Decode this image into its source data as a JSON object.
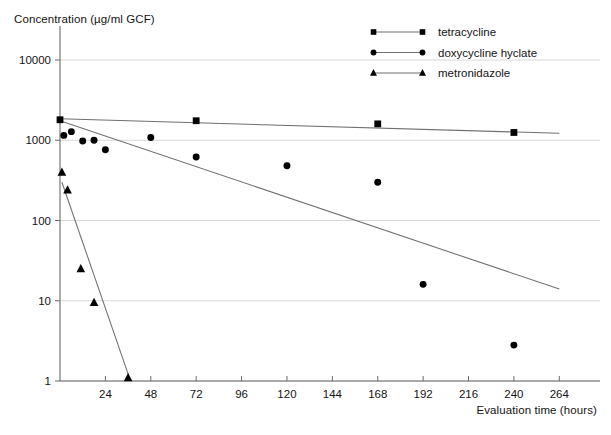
{
  "chart_data": {
    "type": "scatter",
    "title": "",
    "ylabel": "Concentration (µg/ml GCF)",
    "xlabel": "Evaluation time (hours)",
    "yscale": "log",
    "ylim": [
      1,
      10000
    ],
    "xlim": [
      0,
      276
    ],
    "grid": true,
    "legend_position": "top-right",
    "ytick_labels": [
      "1",
      "10",
      "100",
      "1000",
      "10000"
    ],
    "ytick_values": [
      1,
      10,
      100,
      1000,
      10000
    ],
    "xtick_labels": [
      "24",
      "48",
      "72",
      "96",
      "120",
      "144",
      "168",
      "192",
      "216",
      "240",
      "264"
    ],
    "xtick_values": [
      24,
      48,
      72,
      96,
      120,
      144,
      168,
      192,
      216,
      240,
      264
    ],
    "series": [
      {
        "name": "tetracycline",
        "marker": "square",
        "color": "#000000",
        "points": [
          {
            "x": 0,
            "y": 1800
          },
          {
            "x": 72,
            "y": 1750
          },
          {
            "x": 168,
            "y": 1600
          },
          {
            "x": 240,
            "y": 1250
          }
        ],
        "fit": [
          {
            "x": 0,
            "y": 1850
          },
          {
            "x": 264,
            "y": 1220
          }
        ]
      },
      {
        "name": "doxycycline hyclate",
        "marker": "circle",
        "color": "#000000",
        "points": [
          {
            "x": 2,
            "y": 1150
          },
          {
            "x": 6,
            "y": 1280
          },
          {
            "x": 12,
            "y": 980
          },
          {
            "x": 18,
            "y": 1000
          },
          {
            "x": 24,
            "y": 760
          },
          {
            "x": 48,
            "y": 1080
          },
          {
            "x": 72,
            "y": 620
          },
          {
            "x": 120,
            "y": 480
          },
          {
            "x": 168,
            "y": 300
          },
          {
            "x": 192,
            "y": 16
          },
          {
            "x": 240,
            "y": 2.8
          }
        ],
        "fit": [
          {
            "x": 0,
            "y": 1750
          },
          {
            "x": 264,
            "y": 14
          }
        ]
      },
      {
        "name": "metronidazole",
        "marker": "triangle",
        "color": "#000000",
        "points": [
          {
            "x": 1,
            "y": 400
          },
          {
            "x": 4,
            "y": 240
          },
          {
            "x": 11,
            "y": 25
          },
          {
            "x": 18,
            "y": 9.5
          },
          {
            "x": 36,
            "y": 1.1
          }
        ],
        "fit": [
          {
            "x": 1,
            "y": 300
          },
          {
            "x": 37,
            "y": 1.05
          }
        ]
      }
    ]
  },
  "legend": {
    "items": [
      {
        "label": "tetracycline"
      },
      {
        "label": "doxycycline hyclate"
      },
      {
        "label": "metronidazole"
      }
    ]
  }
}
